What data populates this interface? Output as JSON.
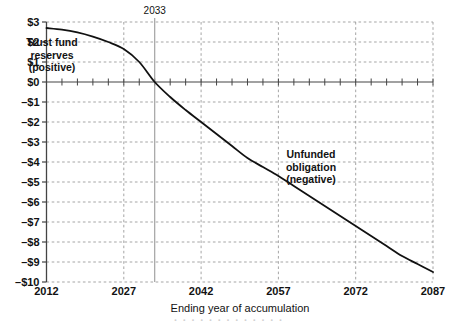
{
  "chart_data": {
    "type": "line",
    "title": "",
    "xlabel": "Ending year of accumulation",
    "ylabel": "",
    "xlim": [
      2012,
      2087
    ],
    "ylim": [
      -10,
      3
    ],
    "grid": true,
    "legend": "none",
    "y_tick_labels": [
      "$3",
      "$2",
      "$1",
      "$0",
      "–$1",
      "–$2",
      "–$3",
      "–$4",
      "–$5",
      "–$6",
      "–$7",
      "–$8",
      "–$9",
      "–$10"
    ],
    "y_tick_values": [
      3,
      2,
      1,
      0,
      -1,
      -2,
      -3,
      -4,
      -5,
      -6,
      -7,
      -8,
      -9,
      -10
    ],
    "x_tick_labels": [
      "2012",
      "2027",
      "2042",
      "2057",
      "2072",
      "2087"
    ],
    "x_tick_values": [
      2012,
      2027,
      2042,
      2057,
      2072,
      2087
    ],
    "x_minor_tick_step": 3,
    "series": [
      {
        "name": "Trust fund reserves / unfunded obligation",
        "x": [
          2012,
          2015,
          2018,
          2021,
          2024,
          2027,
          2030,
          2033,
          2036,
          2039,
          2042,
          2045,
          2048,
          2051,
          2054,
          2057,
          2060,
          2063,
          2066,
          2069,
          2072,
          2075,
          2078,
          2081,
          2084,
          2087
        ],
        "values": [
          2.7,
          2.62,
          2.48,
          2.27,
          2.0,
          1.65,
          1.0,
          0.0,
          -0.75,
          -1.4,
          -2.0,
          -2.6,
          -3.2,
          -3.8,
          -4.25,
          -4.7,
          -5.2,
          -5.7,
          -6.2,
          -6.7,
          -7.2,
          -7.7,
          -8.2,
          -8.7,
          -9.1,
          -9.5
        ]
      }
    ],
    "annotations": [
      {
        "name": "positive-region-label",
        "lines": [
          "Trust fund",
          "reserves",
          "(positive)"
        ],
        "x_px": 52,
        "y_px": 46
      },
      {
        "name": "negative-region-label",
        "lines": [
          "Unfunded",
          "obligation",
          "(negative)"
        ],
        "x_px": 311,
        "y_px": 158
      }
    ],
    "markers": [
      {
        "name": "crossover-year-marker",
        "label": "2033",
        "x_value": 2033,
        "kind": "vertical-line",
        "color": "#9a9a9a"
      }
    ],
    "colors": {
      "line": "#111111",
      "grid": "#9b9b9b",
      "axis": "#444444",
      "marker": "#9a9a9a",
      "background": "#ffffff"
    }
  },
  "artifact": {
    "bottom_smudge": "·  ·   ·  ·   ·    ·  ·  ·   ·  ·    ·   ·  ·"
  }
}
